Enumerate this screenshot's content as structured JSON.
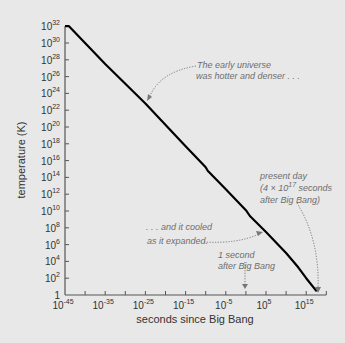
{
  "chart_data": {
    "type": "line",
    "title": "",
    "xlabel": "seconds since Big Bang",
    "ylabel": "temperature (K)",
    "xscale": "log",
    "yscale": "log",
    "xlim_exponent": [
      -45,
      20
    ],
    "ylim_exponent": [
      0,
      32
    ],
    "x_tick_labels": [
      {
        "base": "10",
        "exp": "-45",
        "e": -45
      },
      {
        "base": "10",
        "exp": "-35",
        "e": -35
      },
      {
        "base": "10",
        "exp": "-25",
        "e": -25
      },
      {
        "base": "10",
        "exp": "-15",
        "e": -15
      },
      {
        "base": "10",
        "exp": "-5",
        "e": -5
      },
      {
        "base": "10",
        "exp": "5",
        "e": 5
      },
      {
        "base": "10",
        "exp": "15",
        "e": 15
      }
    ],
    "x_minor_tick_exponents": [
      -40,
      -30,
      -20,
      -10,
      0,
      10,
      20
    ],
    "y_tick_labels": [
      {
        "base": "1",
        "exp": "",
        "e": 0
      },
      {
        "base": "10",
        "exp": "2",
        "e": 2
      },
      {
        "base": "10",
        "exp": "4",
        "e": 4
      },
      {
        "base": "10",
        "exp": "6",
        "e": 6
      },
      {
        "base": "10",
        "exp": "8",
        "e": 8
      },
      {
        "base": "10",
        "exp": "10",
        "e": 10
      },
      {
        "base": "10",
        "exp": "12",
        "e": 12
      },
      {
        "base": "10",
        "exp": "14",
        "e": 14
      },
      {
        "base": "10",
        "exp": "16",
        "e": 16
      },
      {
        "base": "10",
        "exp": "18",
        "e": 18
      },
      {
        "base": "10",
        "exp": "20",
        "e": 20
      },
      {
        "base": "10",
        "exp": "22",
        "e": 22
      },
      {
        "base": "10",
        "exp": "24",
        "e": 24
      },
      {
        "base": "10",
        "exp": "26",
        "e": 26
      },
      {
        "base": "10",
        "exp": "28",
        "e": 28
      },
      {
        "base": "10",
        "exp": "30",
        "e": 30
      },
      {
        "base": "10",
        "exp": "32",
        "e": 32
      }
    ],
    "series": [
      {
        "name": "temperature of the universe",
        "color": "#000000",
        "points_log10": [
          {
            "log_t": -45,
            "log_T": 32
          },
          {
            "log_t": -44,
            "log_T": 32
          },
          {
            "log_t": -35,
            "log_T": 27.5
          },
          {
            "log_t": -25,
            "log_T": 22.8
          },
          {
            "log_t": -15,
            "log_T": 17.7
          },
          {
            "log_t": -10,
            "log_T": 15.2
          },
          {
            "log_t": -9.5,
            "log_T": 14.8
          },
          {
            "log_t": -5,
            "log_T": 12.6
          },
          {
            "log_t": 0,
            "log_T": 10.1
          },
          {
            "log_t": 1,
            "log_T": 9.4
          },
          {
            "log_t": 5,
            "log_T": 7.5
          },
          {
            "log_t": 10,
            "log_T": 5.0
          },
          {
            "log_t": 13,
            "log_T": 3.3
          },
          {
            "log_t": 15,
            "log_T": 2.0
          },
          {
            "log_t": 17.6,
            "log_T": 0.43
          }
        ]
      }
    ],
    "annotations": [
      {
        "lines": [
          "The early universe",
          "was hotter and denser . . ."
        ],
        "target_log_t": -25,
        "target_log_T": 22.8
      },
      {
        "lines": [
          ". . . and it cooled",
          "as it expanded."
        ],
        "target_log_t": 5,
        "target_log_T": 7.5
      },
      {
        "lines": [
          "1 second",
          "after Big Bang"
        ],
        "target_log_t": 0,
        "target_log_T": 0
      },
      {
        "lines": [
          "present day",
          "(4 × 10^17 seconds",
          "after Big Bang)"
        ],
        "target_log_t": 17.6,
        "target_log_T": 0.43
      }
    ],
    "grid": false,
    "legend": null
  },
  "labels": {
    "xlabel": "seconds since Big Bang",
    "ylabel": "temperature (K)",
    "annot_early_1": "The early universe",
    "annot_early_2": "was hotter and denser . . .",
    "annot_cooled_1": ". . . and it cooled",
    "annot_cooled_2": "as it expanded.",
    "annot_second_1": "1 second",
    "annot_second_2": "after Big Bang",
    "annot_present_1": "present day",
    "annot_present_2a": "(4 × 10",
    "annot_present_2sup": "17",
    "annot_present_2b": " seconds",
    "annot_present_3": "after Big Bang)"
  },
  "colors": {
    "background": "#e8e8e8",
    "line": "#000000",
    "axis": "#555555",
    "annotation": "#6e6e6e"
  }
}
